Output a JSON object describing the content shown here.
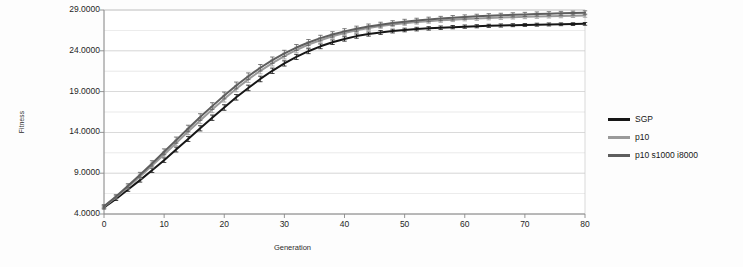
{
  "chart_data": {
    "type": "line",
    "title": "",
    "xlabel": "Generation",
    "ylabel": "Fitness",
    "xlim": [
      0,
      80
    ],
    "ylim": [
      4.0,
      29.0
    ],
    "grid": true,
    "minor_grid": true,
    "legend_position": "right",
    "error_bars": true,
    "x_ticks": [
      "0",
      "10",
      "20",
      "30",
      "40",
      "50",
      "60",
      "70",
      "80"
    ],
    "x_tick_values": [
      0,
      10,
      20,
      30,
      40,
      50,
      60,
      70,
      80
    ],
    "y_ticks": [
      "29.0000",
      "24.0000",
      "19.0000",
      "14.0000",
      "9.0000",
      "4.0000"
    ],
    "y_tick_values": [
      29.0,
      24.0,
      19.0,
      14.0,
      9.0,
      4.0
    ],
    "y_minor_step": 2.5,
    "x": [
      0,
      2,
      4,
      6,
      8,
      10,
      12,
      14,
      16,
      18,
      20,
      22,
      24,
      26,
      28,
      30,
      32,
      34,
      36,
      38,
      40,
      42,
      44,
      46,
      48,
      50,
      52,
      54,
      56,
      58,
      60,
      62,
      64,
      66,
      68,
      70,
      72,
      74,
      76,
      78,
      80
    ],
    "series": [
      {
        "name": "SGP",
        "color": "#161616",
        "values": [
          4.8,
          5.85,
          7.0,
          8.15,
          9.35,
          10.6,
          11.9,
          13.2,
          14.5,
          15.8,
          17.05,
          18.3,
          19.45,
          20.55,
          21.55,
          22.45,
          23.25,
          23.95,
          24.55,
          25.05,
          25.45,
          25.8,
          26.05,
          26.25,
          26.42,
          26.55,
          26.66,
          26.75,
          26.83,
          26.9,
          26.96,
          27.01,
          27.06,
          27.1,
          27.14,
          27.17,
          27.2,
          27.23,
          27.25,
          27.27,
          27.3
        ],
        "errors": [
          0.18,
          0.2,
          0.22,
          0.24,
          0.26,
          0.28,
          0.3,
          0.31,
          0.32,
          0.33,
          0.34,
          0.34,
          0.34,
          0.34,
          0.33,
          0.32,
          0.31,
          0.3,
          0.29,
          0.28,
          0.27,
          0.26,
          0.25,
          0.24,
          0.23,
          0.22,
          0.22,
          0.21,
          0.21,
          0.2,
          0.2,
          0.19,
          0.19,
          0.19,
          0.18,
          0.18,
          0.18,
          0.18,
          0.17,
          0.17,
          0.17
        ]
      },
      {
        "name": "p10",
        "color": "#9a9a9a",
        "values": [
          4.9,
          6.05,
          7.3,
          8.6,
          9.95,
          11.3,
          12.7,
          14.1,
          15.45,
          16.8,
          18.1,
          19.35,
          20.5,
          21.55,
          22.5,
          23.35,
          24.1,
          24.75,
          25.3,
          25.78,
          26.18,
          26.52,
          26.8,
          27.03,
          27.22,
          27.38,
          27.52,
          27.63,
          27.73,
          27.82,
          27.9,
          27.96,
          28.02,
          28.07,
          28.12,
          28.16,
          28.2,
          28.23,
          28.26,
          28.29,
          28.32
        ],
        "errors": [
          0.18,
          0.21,
          0.24,
          0.27,
          0.3,
          0.32,
          0.34,
          0.36,
          0.37,
          0.38,
          0.38,
          0.38,
          0.38,
          0.37,
          0.36,
          0.35,
          0.34,
          0.33,
          0.32,
          0.31,
          0.3,
          0.29,
          0.28,
          0.27,
          0.26,
          0.26,
          0.25,
          0.25,
          0.24,
          0.24,
          0.23,
          0.23,
          0.23,
          0.22,
          0.22,
          0.22,
          0.22,
          0.21,
          0.21,
          0.21,
          0.21
        ]
      },
      {
        "name": "p10 s1000 i8000",
        "color": "#5e5e5e",
        "values": [
          4.95,
          6.15,
          7.45,
          8.8,
          10.2,
          11.62,
          13.05,
          14.48,
          15.88,
          17.22,
          18.52,
          19.75,
          20.88,
          21.92,
          22.85,
          23.68,
          24.4,
          25.02,
          25.55,
          26.0,
          26.38,
          26.7,
          26.97,
          27.2,
          27.4,
          27.57,
          27.71,
          27.84,
          27.95,
          28.05,
          28.14,
          28.22,
          28.29,
          28.35,
          28.41,
          28.46,
          28.51,
          28.55,
          28.59,
          28.62,
          28.66
        ],
        "errors": [
          0.19,
          0.22,
          0.26,
          0.3,
          0.33,
          0.36,
          0.38,
          0.4,
          0.41,
          0.42,
          0.42,
          0.42,
          0.41,
          0.4,
          0.39,
          0.38,
          0.37,
          0.36,
          0.35,
          0.34,
          0.33,
          0.32,
          0.31,
          0.3,
          0.29,
          0.29,
          0.28,
          0.28,
          0.27,
          0.27,
          0.26,
          0.26,
          0.26,
          0.25,
          0.25,
          0.25,
          0.25,
          0.24,
          0.24,
          0.24,
          0.24
        ]
      }
    ]
  },
  "legend": {
    "entries": [
      {
        "label": "SGP",
        "color": "#161616"
      },
      {
        "label": "p10",
        "color": "#9a9a9a"
      },
      {
        "label": "p10 s1000 i8000",
        "color": "#5e5e5e"
      }
    ]
  },
  "plot": {
    "background": "#ffffff",
    "gridline_color": "#c9c9c9",
    "axis_color": "#8a8a8a"
  }
}
